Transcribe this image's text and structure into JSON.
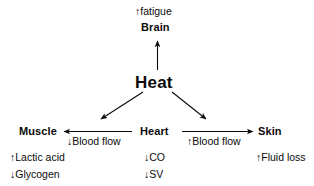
{
  "diagram": {
    "title_node": "Heat",
    "nodes": {
      "brain": {
        "label": "Brain",
        "effect": "↑fatigue"
      },
      "heat": {
        "label": "Heat"
      },
      "muscle": {
        "label": "Muscle",
        "effects": [
          "↑Lactic acid",
          "↓Glycogen"
        ]
      },
      "heart": {
        "label": "Heart",
        "effects": [
          "↓CO",
          "↓SV"
        ]
      },
      "skin": {
        "label": "Skin",
        "effects": [
          "↑Fluid loss"
        ]
      }
    },
    "edges": {
      "heart_to_muscle": "↓Blood flow",
      "heart_to_skin": "↑Blood flow"
    },
    "colors": {
      "ink": "#0a0a0a",
      "background": "#ffffff"
    }
  }
}
